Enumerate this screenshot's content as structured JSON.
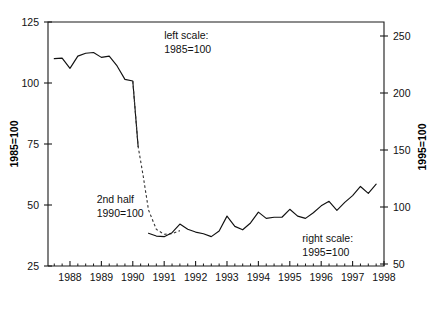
{
  "chart_data": {
    "type": "line",
    "title": "",
    "subtitle": "",
    "xlabel": "",
    "ylabel": "1985=100",
    "y2label": "1995=100",
    "xlim": [
      1987.3,
      1998.0
    ],
    "ylim": [
      25,
      125
    ],
    "y2lim": [
      50,
      250
    ],
    "grid": false,
    "legend_position": "none",
    "x_ticks": [
      1988,
      1989,
      1990,
      1991,
      1992,
      1993,
      1994,
      1995,
      1996,
      1997,
      1998
    ],
    "x_tick_labels": [
      "1988",
      "1989",
      "1990",
      "1991",
      "1992",
      "1993",
      "1994",
      "1995",
      "1996",
      "1997",
      "1998"
    ],
    "x_minor_tick_step": 0.25,
    "y_ticks": [
      25,
      50,
      75,
      100,
      125
    ],
    "y_tick_labels": [
      "25",
      "50",
      "75",
      "100",
      "125"
    ],
    "y2_ticks": [
      50,
      100,
      150,
      200,
      250
    ],
    "y2_tick_labels": [
      "50",
      "100",
      "150",
      "200",
      "250"
    ],
    "annotations": [
      {
        "id": "left-scale-note",
        "line1": "left scale:",
        "line2": "1985=100",
        "x": 1991.0,
        "y": 118
      },
      {
        "id": "second-half-note",
        "line1": "2nd half",
        "line2": "1990=100",
        "x": 1988.85,
        "y": 51
      },
      {
        "id": "right-scale-note",
        "line1": "right scale:",
        "line2": "1995=100",
        "x": 1995.4,
        "y": 35
      }
    ],
    "series": [
      {
        "name": "left scale series (1985=100)",
        "axis": "left",
        "style": "solid",
        "x": [
          1987.5,
          1987.75,
          1988.0,
          1988.25,
          1988.5,
          1988.75,
          1989.0,
          1989.25,
          1989.5,
          1989.75,
          1990.0,
          1990.17
        ],
        "values": [
          110.0,
          110.2,
          106.0,
          111.0,
          112.2,
          112.5,
          110.5,
          111.0,
          107.0,
          101.5,
          100.8,
          74.0
        ]
      },
      {
        "name": "2nd half 1990=100 transition series",
        "axis": "left",
        "style": "dashed",
        "x": [
          1990.0,
          1990.17,
          1990.33,
          1990.5,
          1990.75,
          1991.0,
          1991.25,
          1991.5
        ],
        "values": [
          100.8,
          74.0,
          62.0,
          48.0,
          40.0,
          38.0,
          38.2,
          39.5
        ]
      },
      {
        "name": "right scale series (1995=100)",
        "axis": "right",
        "style": "solid",
        "x": [
          1990.5,
          1990.75,
          1991.0,
          1991.25,
          1991.5,
          1991.75,
          1992.0,
          1992.25,
          1992.5,
          1992.75,
          1993.0,
          1993.25,
          1993.5,
          1993.75,
          1994.0,
          1994.25,
          1994.5,
          1994.75,
          1995.0,
          1995.25,
          1995.5,
          1995.75,
          1996.0,
          1996.25,
          1996.5,
          1996.75,
          1997.0,
          1997.25,
          1997.5,
          1997.75
        ],
        "values": [
          77.0,
          74.5,
          74.0,
          77.5,
          85.0,
          80.5,
          78.0,
          76.5,
          74.0,
          79.0,
          92.0,
          83.0,
          80.0,
          86.0,
          95.5,
          90.0,
          91.0,
          91.0,
          98.0,
          92.0,
          90.0,
          95.0,
          101.0,
          105.0,
          97.0,
          104.0,
          110.0,
          118.0,
          112.0,
          120.0
        ]
      }
    ]
  },
  "axes": {
    "left_title": "1985=100",
    "right_title": "1995=100"
  }
}
